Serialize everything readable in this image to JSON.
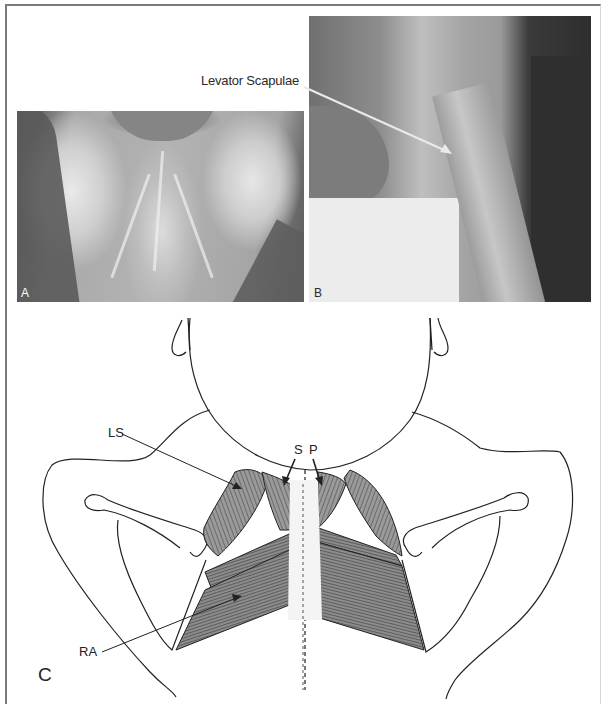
{
  "figure": {
    "panels": [
      {
        "id": "A",
        "label": "A",
        "type": "photograph",
        "description": "posterior neck/upper back dissection"
      },
      {
        "id": "B",
        "label": "B",
        "type": "photograph",
        "description": "lateral neck dissection"
      },
      {
        "id": "C",
        "label": "C",
        "type": "illustration",
        "description": "posterior view line drawing of neck and scapular muscles"
      }
    ],
    "callouts": {
      "panel_b": {
        "text": "Levator Scapulae",
        "arrow_color": "#e8e8e8"
      }
    },
    "drawing_labels": {
      "ls": "LS",
      "s": "S",
      "p": "P",
      "ra": "RA",
      "c": "C"
    },
    "colors": {
      "frame_border": "#7a7a7a",
      "ink": "#222222",
      "muscle_dark": "#4a4a4a",
      "muscle_mid": "#8a8a8a",
      "muscle_light": "#bdbdbd"
    }
  }
}
